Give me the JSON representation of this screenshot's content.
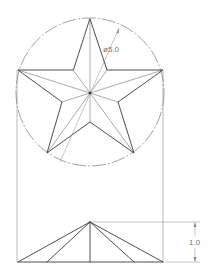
{
  "drawing": {
    "title": "Five-point star — plan and elevation",
    "dimensions": {
      "diameter_label": "ø5.0",
      "height_label": "1.0"
    },
    "colors": {
      "object_line": "#3a3a3a",
      "construction_line": "#8a8a8a",
      "dimension_text": "#777777",
      "background": "#ffffff"
    },
    "views": [
      "plan",
      "elevation"
    ]
  }
}
